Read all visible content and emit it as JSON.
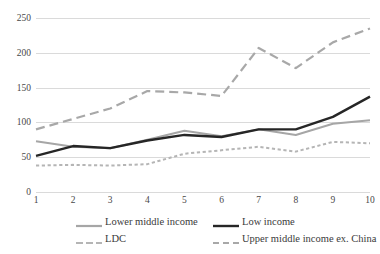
{
  "figure": {
    "clipped_caption": ""
  },
  "chart_data": {
    "type": "line",
    "title": "",
    "subtitle": "",
    "xlabel": "",
    "ylabel": "",
    "x": [
      1,
      2,
      3,
      4,
      5,
      6,
      7,
      8,
      9,
      10
    ],
    "xtick_labels": [
      "1",
      "2",
      "3",
      "4",
      "5",
      "6",
      "7",
      "8",
      "9",
      "10"
    ],
    "ytick_labels": [
      "0",
      "50",
      "100",
      "150",
      "200",
      "250"
    ],
    "yticks": [
      0,
      50,
      100,
      150,
      200,
      250
    ],
    "ylim": [
      0,
      250
    ],
    "xlim": [
      1,
      10
    ],
    "grid": "horizontal",
    "legend_position": "bottom",
    "series": [
      {
        "name": "Lower middle income",
        "style": "solid",
        "color": "#a6a6a6",
        "width": 2.0,
        "values": [
          73,
          65,
          63,
          75,
          88,
          80,
          90,
          82,
          98,
          103
        ]
      },
      {
        "name": "Low income",
        "style": "solid",
        "color": "#262626",
        "width": 2.4,
        "values": [
          52,
          66,
          63,
          74,
          82,
          79,
          90,
          90,
          108,
          137
        ]
      },
      {
        "name": "LDC",
        "style": "dotted",
        "color": "#b5b5b5",
        "width": 2.0,
        "values": [
          38,
          39,
          38,
          40,
          55,
          60,
          65,
          58,
          72,
          70
        ]
      },
      {
        "name": "Upper middle income ex. China",
        "style": "dashed",
        "color": "#a8a8a8",
        "width": 2.2,
        "values": [
          90,
          105,
          120,
          145,
          143,
          138,
          207,
          178,
          215,
          235
        ]
      }
    ]
  }
}
